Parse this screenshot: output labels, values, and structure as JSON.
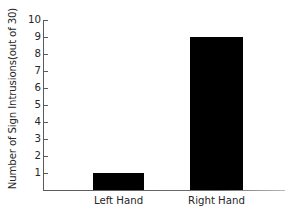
{
  "chart_data": {
    "type": "bar",
    "title": "",
    "xlabel": "",
    "ylabel": "Number of Sign Intrusions(out of 30)",
    "categories": [
      "Left Hand",
      "Right Hand"
    ],
    "values": [
      1,
      9
    ],
    "ylim": [
      0,
      10
    ],
    "yticks": [
      1,
      2,
      3,
      4,
      5,
      6,
      7,
      8,
      9,
      10
    ],
    "ytick_labels": [
      "1",
      "2",
      "3",
      "4",
      "5",
      "6",
      "7",
      "8",
      "9",
      "10"
    ],
    "grid": false,
    "legend": false,
    "bar_color": "#000000",
    "axis_color": "#5a5a5a",
    "background_color": "#ffffff"
  },
  "axis": {
    "y_title": "Number of Sign Intrusions(out of 30)"
  }
}
